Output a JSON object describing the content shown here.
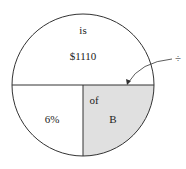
{
  "diagram": {
    "type": "percentage-circle",
    "top_word": "is",
    "top_value": "$1110",
    "bottom_left_value": "6%",
    "bottom_right_word": "of",
    "bottom_right_value": "B",
    "operator_symbol": "÷",
    "colors": {
      "stroke": "#333333",
      "shaded": "#e0e0e0",
      "background": "#ffffff"
    }
  }
}
